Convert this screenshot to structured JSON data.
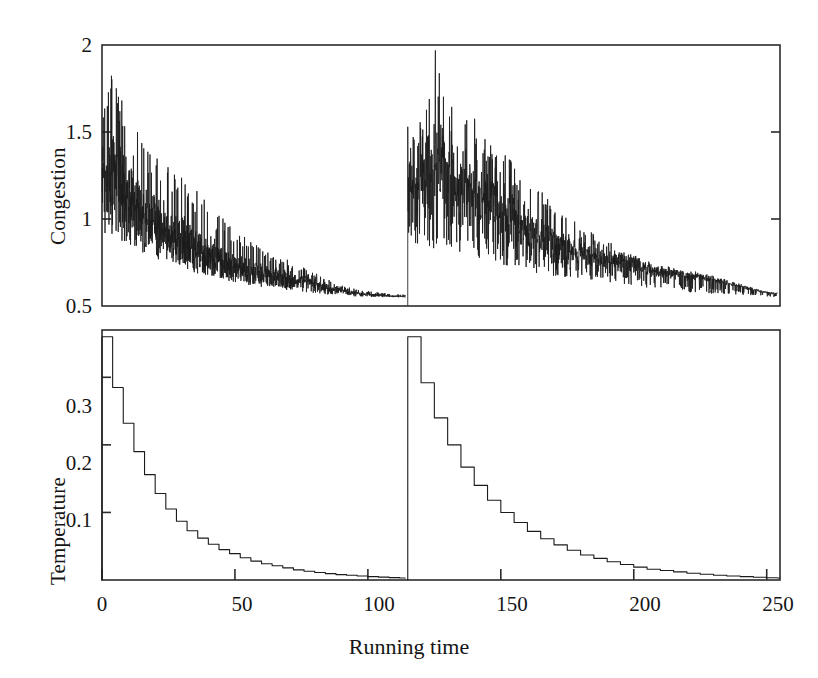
{
  "figure": {
    "xaxis_title": "Running time",
    "width": 818,
    "height": 678,
    "line_color": "#1b1b1b",
    "frame_color": "#2b2b2b",
    "background": "#ffffff"
  },
  "panels": {
    "congestion": {
      "ylabel": "Congestion",
      "yticks": [
        "2",
        "1.5",
        "1",
        "0.5"
      ],
      "ytick_values": [
        2,
        1.5,
        1,
        0.5
      ],
      "ylim": [
        0.5,
        2
      ],
      "xlim": [
        0,
        255
      ],
      "xticks_visible": false
    },
    "temperature": {
      "ylabel": "Temperature",
      "yticks": [
        "0.3",
        "0.2",
        "0.1"
      ],
      "ytick_values": [
        0.3,
        0.2,
        0.1
      ],
      "ylim": [
        0,
        0.37
      ],
      "xlim": [
        0,
        255
      ],
      "xticks": [
        "0",
        "50",
        "100",
        "150",
        "200",
        "250"
      ],
      "xtick_values": [
        0,
        50,
        100,
        150,
        200,
        250
      ]
    }
  },
  "chart_data": [
    {
      "type": "line",
      "title": "",
      "xlabel": "Running time",
      "ylabel": "Congestion",
      "xlim": [
        0,
        255
      ],
      "ylim": [
        0.5,
        2
      ],
      "grid": false,
      "legend": "none",
      "xticks": [
        0,
        50,
        100,
        150,
        200,
        250
      ],
      "yticks": [
        0.5,
        1,
        1.5,
        2
      ],
      "description": "Noisy congestion trace from two successive simulated-annealing runs; each run starts with large oscillations that decay toward a floor near 0.55. A restart discontinuity occurs at running time 115.",
      "restart_time": 115,
      "noise_floor": 0.55,
      "series": [
        {
          "name": "Congestion run 1",
          "x_start": 0,
          "x_end": 114,
          "envelope_upper": [
            1.62,
            1.92,
            1.8,
            1.7,
            1.55,
            1.5,
            1.44,
            1.4,
            1.36,
            1.32,
            1.28,
            1.25,
            1.22,
            1.18,
            1.14,
            1.1,
            1.05,
            1.0,
            0.96,
            0.92,
            0.89,
            0.86,
            0.84,
            0.82,
            0.8,
            0.78,
            0.76,
            0.74,
            0.72,
            0.7,
            0.68,
            0.66,
            0.64,
            0.62,
            0.61,
            0.6,
            0.59,
            0.585,
            0.58,
            0.575,
            0.57,
            0.57,
            0.565
          ],
          "envelope_lower": [
            0.92,
            0.9,
            0.88,
            0.86,
            0.84,
            0.82,
            0.8,
            0.78,
            0.76,
            0.74,
            0.73,
            0.72,
            0.7,
            0.69,
            0.68,
            0.67,
            0.66,
            0.65,
            0.64,
            0.63,
            0.62,
            0.615,
            0.61,
            0.605,
            0.6,
            0.595,
            0.59,
            0.585,
            0.58,
            0.575,
            0.57,
            0.567,
            0.564,
            0.561,
            0.558,
            0.556,
            0.554,
            0.553,
            0.552,
            0.551,
            0.551,
            0.55,
            0.55
          ],
          "mean_trend": [
            1.27,
            1.3,
            1.24,
            1.18,
            1.12,
            1.06,
            1.02,
            0.99,
            0.96,
            0.93,
            0.9,
            0.88,
            0.86,
            0.84,
            0.81,
            0.79,
            0.77,
            0.75,
            0.73,
            0.72,
            0.71,
            0.7,
            0.69,
            0.68,
            0.67,
            0.66,
            0.655,
            0.65,
            0.645,
            0.64,
            0.62,
            0.61,
            0.6,
            0.59,
            0.58,
            0.575,
            0.57,
            0.565,
            0.562,
            0.56,
            0.558,
            0.556,
            0.555
          ]
        },
        {
          "name": "Congestion run 2",
          "x_start": 115,
          "x_end": 254,
          "envelope_upper": [
            1.55,
            1.52,
            1.58,
            1.66,
            2.0,
            1.8,
            1.74,
            1.62,
            1.56,
            1.7,
            1.54,
            1.5,
            1.46,
            1.44,
            1.4,
            1.36,
            1.3,
            1.26,
            1.22,
            1.18,
            1.14,
            1.1,
            1.06,
            1.02,
            1.0,
            0.97,
            0.94,
            0.92,
            0.9,
            0.88,
            0.86,
            0.84,
            0.82,
            0.8,
            0.78,
            0.76,
            0.74,
            0.73,
            0.72,
            0.71,
            0.7,
            0.69,
            0.68,
            0.67,
            0.66,
            0.65,
            0.64,
            0.63,
            0.62,
            0.61,
            0.6,
            0.59,
            0.585,
            0.58,
            0.575
          ],
          "envelope_lower": [
            0.88,
            0.86,
            0.85,
            0.84,
            0.83,
            0.82,
            0.81,
            0.8,
            0.79,
            0.78,
            0.77,
            0.76,
            0.75,
            0.74,
            0.73,
            0.72,
            0.71,
            0.7,
            0.69,
            0.685,
            0.68,
            0.675,
            0.67,
            0.665,
            0.66,
            0.655,
            0.65,
            0.645,
            0.64,
            0.635,
            0.63,
            0.625,
            0.62,
            0.615,
            0.61,
            0.605,
            0.6,
            0.595,
            0.59,
            0.585,
            0.58,
            0.578,
            0.576,
            0.574,
            0.572,
            0.57,
            0.568,
            0.566,
            0.564,
            0.562,
            0.56,
            0.558,
            0.556,
            0.554,
            0.552
          ],
          "mean_trend": [
            1.2,
            1.18,
            1.2,
            1.24,
            1.3,
            1.26,
            1.22,
            1.18,
            1.16,
            1.2,
            1.14,
            1.1,
            1.08,
            1.06,
            1.03,
            1.0,
            0.97,
            0.95,
            0.93,
            0.91,
            0.89,
            0.87,
            0.85,
            0.84,
            0.82,
            0.81,
            0.8,
            0.79,
            0.78,
            0.77,
            0.76,
            0.75,
            0.74,
            0.73,
            0.72,
            0.71,
            0.7,
            0.695,
            0.69,
            0.685,
            0.68,
            0.675,
            0.67,
            0.665,
            0.66,
            0.65,
            0.64,
            0.63,
            0.62,
            0.61,
            0.6,
            0.59,
            0.58,
            0.575,
            0.57
          ]
        }
      ]
    },
    {
      "type": "line",
      "title": "",
      "xlabel": "Running time",
      "ylabel": "Temperature",
      "xlim": [
        0,
        255
      ],
      "ylim": [
        0,
        0.37
      ],
      "grid": false,
      "legend": "none",
      "xticks": [
        0,
        50,
        100,
        150,
        200,
        250
      ],
      "yticks": [
        0.1,
        0.2,
        0.3
      ],
      "description": "Geometric cooling schedule shown as a descending staircase; two annealing runs, the second restarting at running time 115 from the same initial temperature 0.36.",
      "restart_time": 115,
      "initial_temperature": 0.36,
      "series": [
        {
          "name": "Temperature run 1",
          "x": [
            0,
            4,
            8,
            12,
            16,
            20,
            24,
            28,
            32,
            36,
            40,
            44,
            48,
            52,
            56,
            60,
            64,
            68,
            72,
            76,
            80,
            84,
            88,
            92,
            96,
            100,
            104,
            108,
            112,
            114
          ],
          "values": [
            0.36,
            0.285,
            0.232,
            0.19,
            0.156,
            0.128,
            0.105,
            0.087,
            0.073,
            0.062,
            0.053,
            0.045,
            0.039,
            0.033,
            0.028,
            0.024,
            0.021,
            0.018,
            0.015,
            0.013,
            0.011,
            0.0095,
            0.008,
            0.007,
            0.006,
            0.005,
            0.0042,
            0.0035,
            0.003,
            0.0028
          ]
        },
        {
          "name": "Temperature run 2",
          "x": [
            115,
            120,
            125,
            130,
            135,
            140,
            145,
            150,
            155,
            160,
            165,
            170,
            175,
            180,
            185,
            190,
            195,
            200,
            205,
            210,
            215,
            220,
            225,
            230,
            235,
            240,
            245,
            250,
            254
          ],
          "values": [
            0.36,
            0.292,
            0.24,
            0.2,
            0.167,
            0.14,
            0.118,
            0.1,
            0.085,
            0.072,
            0.061,
            0.052,
            0.044,
            0.037,
            0.032,
            0.027,
            0.023,
            0.019,
            0.016,
            0.014,
            0.012,
            0.01,
            0.0085,
            0.007,
            0.006,
            0.005,
            0.004,
            0.0034,
            0.003
          ]
        }
      ]
    }
  ]
}
